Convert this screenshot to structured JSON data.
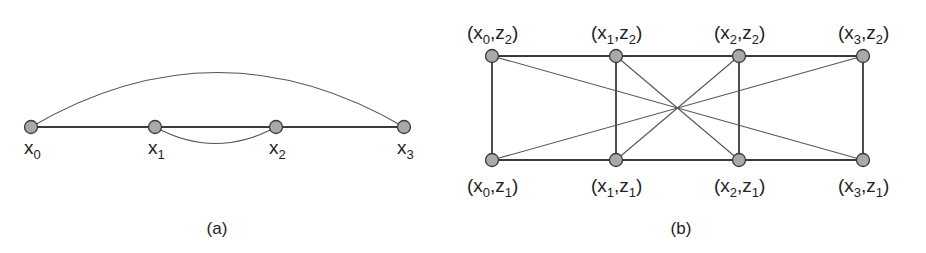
{
  "panel_a": {
    "caption": "(a)",
    "nodes": [
      {
        "id": "x0",
        "base": "x",
        "sub": "0"
      },
      {
        "id": "x1",
        "base": "x",
        "sub": "1"
      },
      {
        "id": "x2",
        "base": "x",
        "sub": "2"
      },
      {
        "id": "x3",
        "base": "x",
        "sub": "3"
      }
    ],
    "edges": [
      {
        "from": "x0",
        "to": "x1",
        "kind": "straight"
      },
      {
        "from": "x1",
        "to": "x2",
        "kind": "straight"
      },
      {
        "from": "x2",
        "to": "x3",
        "kind": "straight"
      },
      {
        "from": "x0",
        "to": "x3",
        "kind": "arc-above"
      },
      {
        "from": "x1",
        "to": "x2",
        "kind": "arc-below"
      }
    ]
  },
  "panel_b": {
    "caption": "(b)",
    "nodes": [
      {
        "id": "x0z2",
        "x": "x",
        "xs": "0",
        "z": "z",
        "zs": "2",
        "row": "top",
        "col": 0
      },
      {
        "id": "x1z2",
        "x": "x",
        "xs": "1",
        "z": "z",
        "zs": "2",
        "row": "top",
        "col": 1
      },
      {
        "id": "x2z2",
        "x": "x",
        "xs": "2",
        "z": "z",
        "zs": "2",
        "row": "top",
        "col": 2
      },
      {
        "id": "x3z2",
        "x": "x",
        "xs": "3",
        "z": "z",
        "zs": "2",
        "row": "top",
        "col": 3
      },
      {
        "id": "x0z1",
        "x": "x",
        "xs": "0",
        "z": "z",
        "zs": "1",
        "row": "bottom",
        "col": 0
      },
      {
        "id": "x1z1",
        "x": "x",
        "xs": "1",
        "z": "z",
        "zs": "1",
        "row": "bottom",
        "col": 1
      },
      {
        "id": "x2z1",
        "x": "x",
        "xs": "2",
        "z": "z",
        "zs": "1",
        "row": "bottom",
        "col": 2
      },
      {
        "id": "x3z1",
        "x": "x",
        "xs": "3",
        "z": "z",
        "zs": "1",
        "row": "bottom",
        "col": 3
      }
    ],
    "edges": [
      {
        "from": "x0z2",
        "to": "x1z2",
        "kind": "main"
      },
      {
        "from": "x1z2",
        "to": "x2z2",
        "kind": "main"
      },
      {
        "from": "x2z2",
        "to": "x3z2",
        "kind": "main"
      },
      {
        "from": "x0z1",
        "to": "x1z1",
        "kind": "main"
      },
      {
        "from": "x1z1",
        "to": "x2z1",
        "kind": "main"
      },
      {
        "from": "x2z1",
        "to": "x3z1",
        "kind": "main"
      },
      {
        "from": "x0z2",
        "to": "x0z1",
        "kind": "main"
      },
      {
        "from": "x1z2",
        "to": "x1z1",
        "kind": "main"
      },
      {
        "from": "x2z2",
        "to": "x2z1",
        "kind": "main"
      },
      {
        "from": "x3z2",
        "to": "x3z1",
        "kind": "main"
      },
      {
        "from": "x0z2",
        "to": "x3z1",
        "kind": "thin"
      },
      {
        "from": "x3z2",
        "to": "x0z1",
        "kind": "thin"
      },
      {
        "from": "x1z2",
        "to": "x2z1",
        "kind": "thin"
      },
      {
        "from": "x2z2",
        "to": "x1z1",
        "kind": "thin"
      }
    ]
  }
}
